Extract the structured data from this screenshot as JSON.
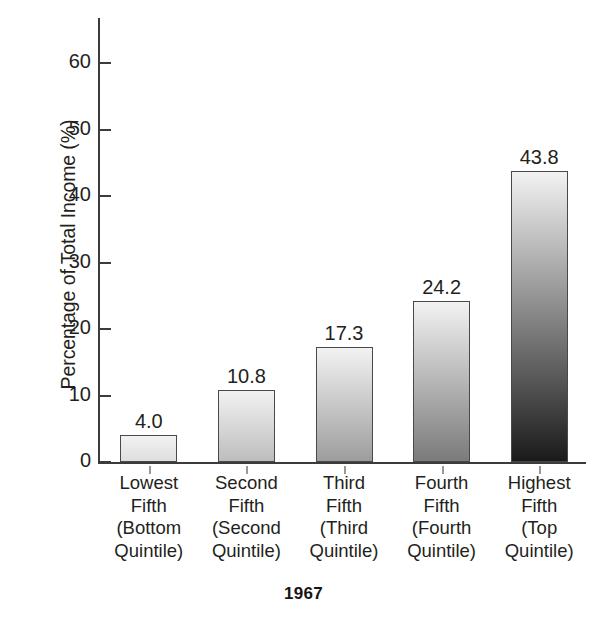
{
  "chart_data": {
    "type": "bar",
    "title": "1967",
    "xlabel": "",
    "ylabel": "Percentage of Total Income (%)",
    "ylim": [
      0,
      65
    ],
    "yticks": [
      0,
      10,
      20,
      30,
      40,
      50,
      60
    ],
    "ytick_labels": [
      "0",
      "10",
      "20",
      "30",
      "40",
      "50",
      "60"
    ],
    "grid": false,
    "legend": false,
    "categories": [
      "Lowest Fifth (Bottom Quintile)",
      "Second Fifth (Second Quintile)",
      "Third Fifth (Third Quintile)",
      "Fourth Fifth (Fourth Quintile)",
      "Highest Fifth (Top Quintile)"
    ],
    "category_lines": [
      [
        "Lowest",
        "Fifth",
        "(Bottom",
        "Quintile)"
      ],
      [
        "Second",
        "Fifth",
        "(Second",
        "Quintile)"
      ],
      [
        "Third",
        "Fifth",
        "(Third",
        "Quintile)"
      ],
      [
        "Fourth",
        "Fifth",
        "(Fourth",
        "Quintile)"
      ],
      [
        "Highest",
        "Fifth",
        "(Top",
        "Quintile)"
      ]
    ],
    "values": [
      4.0,
      10.8,
      17.3,
      24.2,
      43.8
    ],
    "value_labels": [
      "4.0",
      "10.8",
      "17.3",
      "24.2",
      "43.8"
    ],
    "bar_style": "vertical gradient, light top to dark bottom, thin dark outline",
    "colors": {
      "bar_gradient_top": "#f2f2f2",
      "bar_gradient_bottom": "#1a1a1a",
      "bar_outline": "#4a484a",
      "axis": "#3b3a3c",
      "text": "#231f20",
      "background": "#ffffff"
    }
  }
}
